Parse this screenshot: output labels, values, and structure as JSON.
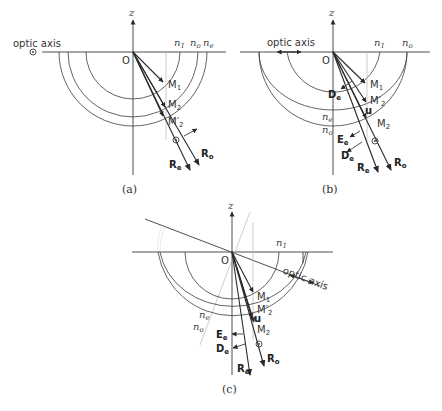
{
  "panels": [
    {
      "id": "a",
      "caption": "(a)",
      "z_label": "z",
      "origin_label": "O",
      "optic_axis_label": "optic axis",
      "optic_axis_symbol": "⊙",
      "index_labels": [
        "n",
        "n",
        "n"
      ],
      "index_subs": [
        "1",
        "o",
        "e"
      ],
      "point_labels": [
        "M",
        "M",
        "M′"
      ],
      "point_subs": [
        "1",
        "2",
        "2"
      ],
      "ray_labels": [
        "R",
        "R"
      ],
      "ray_subs": [
        "e",
        "o"
      ],
      "polarization_symbol": "⊙"
    },
    {
      "id": "b",
      "caption": "(b)",
      "z_label": "z",
      "origin_label": "O",
      "optic_axis_label": "optic axis",
      "index_labels": [
        "n",
        "n",
        "n",
        "n"
      ],
      "index_subs": [
        "1",
        "o",
        "e",
        "o"
      ],
      "point_labels": [
        "M",
        "M′",
        "M"
      ],
      "point_subs": [
        "1",
        "2",
        "2"
      ],
      "vector_labels": [
        "D",
        "u",
        "E",
        "D"
      ],
      "vector_subs": [
        "e",
        "",
        "e",
        "e"
      ],
      "ray_labels": [
        "R",
        "R"
      ],
      "ray_subs": [
        "e",
        "o"
      ],
      "polarization_symbol": "⊙"
    },
    {
      "id": "c",
      "caption": "(c)",
      "z_label": "z",
      "origin_label": "O",
      "optic_axis_label": "optic axis",
      "index_labels": [
        "n",
        "n",
        "n"
      ],
      "index_subs": [
        "1",
        "e",
        "o"
      ],
      "point_labels": [
        "M",
        "M′",
        "M"
      ],
      "point_subs": [
        "1",
        "2",
        "2"
      ],
      "vector_labels": [
        "u",
        "E",
        "D"
      ],
      "vector_subs": [
        "",
        "e",
        "e"
      ],
      "ray_labels": [
        "R",
        "R"
      ],
      "ray_subs": [
        "e",
        "o"
      ],
      "polarization_symbol": "⊙"
    }
  ]
}
